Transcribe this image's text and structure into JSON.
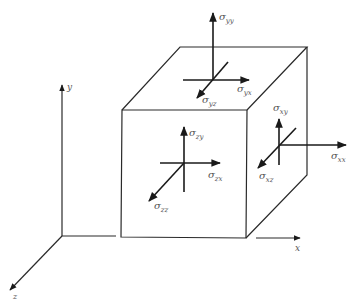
{
  "axes": {
    "x": "x",
    "y": "y",
    "z": "z"
  },
  "stresses": {
    "yy": {
      "symbol": "σ",
      "sub": "yy"
    },
    "yx": {
      "symbol": "σ",
      "sub": "yx"
    },
    "yz": {
      "symbol": "σ",
      "sub": "yz"
    },
    "zy": {
      "symbol": "σ",
      "sub": "zy"
    },
    "zx": {
      "symbol": "σ",
      "sub": "zx"
    },
    "zz": {
      "symbol": "σ",
      "sub": "zz"
    },
    "xy": {
      "symbol": "σ",
      "sub": "xy"
    },
    "xx": {
      "symbol": "σ",
      "sub": "xx"
    },
    "xz": {
      "symbol": "σ",
      "sub": "xz"
    }
  },
  "colors": {
    "line": "#2a2a2a",
    "label": "#555555",
    "background": "#ffffff"
  }
}
